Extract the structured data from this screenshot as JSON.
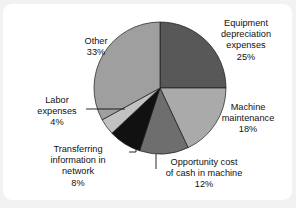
{
  "card": {
    "background": "#ffffff",
    "page_background": "#f2f2f2"
  },
  "chart_data": {
    "type": "pie",
    "title": "",
    "subtitle": "",
    "xlabel": "",
    "ylabel": "",
    "legend_position": "none",
    "grid": false,
    "units": "%",
    "total": 100,
    "start_angle_deg": 0,
    "direction": "clockwise",
    "center": {
      "x": 160,
      "y": 88
    },
    "radius": 66,
    "categories": [
      "Equipment depreciation expenses",
      "Machine maintenance",
      "Opportunity cost of cash in machine",
      "Transferring information in network",
      "Labor expenses",
      "Other"
    ],
    "values": [
      25,
      18,
      12,
      8,
      4,
      33
    ],
    "colors": [
      "#585858",
      "#aaaaaa",
      "#6e6e6e",
      "#111111",
      "#c2c2c2",
      "#9f9f9f"
    ],
    "slices": [
      {
        "key": "equipment",
        "name": "Equipment depreciation expenses",
        "value": 25,
        "value_label": "25%",
        "color": "#585858",
        "label_lines": [
          "Equipment",
          "depreciation",
          "expenses",
          "25%"
        ],
        "label_x": 246,
        "label_y": 26,
        "leader": false
      },
      {
        "key": "machine-maintenance",
        "name": "Machine maintenance",
        "value": 18,
        "value_label": "18%",
        "color": "#aaaaaa",
        "label_lines": [
          "Machine",
          "maintenance",
          "18%"
        ],
        "label_x": 248,
        "label_y": 110,
        "leader": false
      },
      {
        "key": "opportunity-cost",
        "name": "Opportunity cost of cash in machine",
        "value": 12,
        "value_label": "12%",
        "color": "#6e6e6e",
        "label_lines": [
          "Opportunity cost",
          "of cash in machine",
          "12%"
        ],
        "label_x": 204,
        "label_y": 165,
        "leader": true
      },
      {
        "key": "transferring-information",
        "name": "Transferring information in network",
        "value": 8,
        "value_label": "8%",
        "color": "#111111",
        "label_lines": [
          "Transferring",
          "information in",
          "network",
          "8%"
        ],
        "label_x": 78,
        "label_y": 152,
        "leader": true
      },
      {
        "key": "labor-expenses",
        "name": "Labor expenses",
        "value": 4,
        "value_label": "4%",
        "color": "#c2c2c2",
        "label_lines": [
          "Labor",
          "expenses",
          "4%"
        ],
        "label_x": 57,
        "label_y": 103,
        "leader": true
      },
      {
        "key": "other",
        "name": "Other",
        "value": 33,
        "value_label": "33%",
        "color": "#9f9f9f",
        "label_lines": [
          "Other",
          "33%"
        ],
        "label_x": 96,
        "label_y": 44,
        "leader": false
      }
    ]
  }
}
